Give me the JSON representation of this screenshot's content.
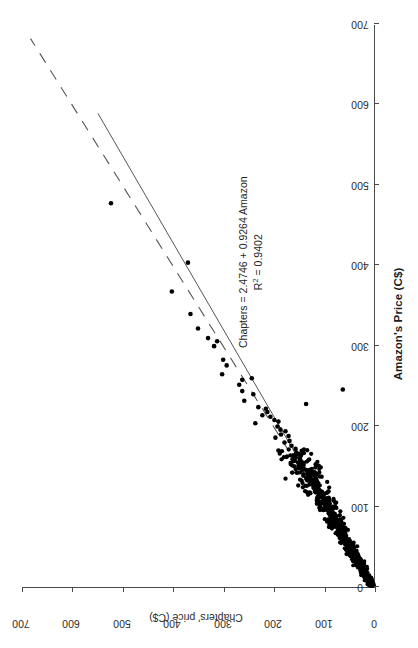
{
  "chart_data": {
    "type": "scatter",
    "title": "",
    "xlabel": "Amazon's Price (C$)",
    "ylabel": "Chapters' price (C$)",
    "xlim": [
      0,
      700
    ],
    "ylim": [
      0,
      700
    ],
    "xticks": [
      0,
      100,
      200,
      300,
      400,
      500,
      600,
      700
    ],
    "yticks": [
      0,
      100,
      200,
      300,
      400,
      500,
      600,
      700
    ],
    "grid": false,
    "legend": "none",
    "orientation": "page rotated 90 degrees (landscape chart on portrait page)",
    "annotations": [
      {
        "name": "regression-equation",
        "line1": "Chapters = 2.4746 + 0.9264 Amazon",
        "line2_prefix": "R",
        "line2_sup": "2",
        "line2_suffix": " = 0.9402",
        "x": 430,
        "y": 300
      }
    ],
    "fit_line": {
      "name": "regression-line",
      "style": "solid",
      "intercept": 2.4746,
      "slope": 0.9264,
      "x_start": 0,
      "x_end": 590
    },
    "reference_line": {
      "name": "identity-line",
      "style": "dashed",
      "intercept": 0,
      "slope": 1,
      "x_start": 0,
      "x_end": 683
    },
    "series": [
      {
        "name": "Book prices",
        "marker": "filled-circle",
        "color": "#000000",
        "n_points": 960,
        "outliers": [
          [
            478,
            523
          ],
          [
            404,
            370
          ],
          [
            368,
            402
          ],
          [
            340,
            365
          ],
          [
            322,
            350
          ],
          [
            310,
            330
          ],
          [
            306,
            312
          ],
          [
            300,
            318
          ],
          [
            283,
            300
          ],
          [
            276,
            293
          ],
          [
            265,
            302
          ],
          [
            260,
            243
          ],
          [
            258,
            262
          ],
          [
            252,
            268
          ],
          [
            244,
            262
          ],
          [
            240,
            240
          ],
          [
            232,
            258
          ],
          [
            228,
            135
          ],
          [
            224,
            230
          ],
          [
            222,
            215
          ],
          [
            218,
            212
          ],
          [
            214,
            222
          ],
          [
            212,
            206
          ],
          [
            208,
            198
          ],
          [
            206,
            190
          ],
          [
            204,
            236
          ],
          [
            200,
            192
          ],
          [
            196,
            186
          ],
          [
            194,
            176
          ],
          [
            190,
            185
          ],
          [
            188,
            170
          ],
          [
            186,
            196
          ],
          [
            182,
            168
          ],
          [
            180,
            178
          ],
          [
            176,
            164
          ],
          [
            172,
            156
          ],
          [
            170,
            190
          ],
          [
            166,
            150
          ],
          [
            164,
            160
          ],
          [
            160,
            148
          ],
          [
            156,
            145
          ],
          [
            152,
            140
          ],
          [
            150,
            158
          ],
          [
            146,
            136
          ],
          [
            144,
            130
          ],
          [
            140,
            132
          ],
          [
            136,
            128
          ],
          [
            134,
            124
          ],
          [
            130,
            126
          ],
          [
            128,
            118
          ],
          [
            124,
            120
          ],
          [
            120,
            112
          ],
          [
            118,
            116
          ],
          [
            114,
            108
          ],
          [
            112,
            110
          ],
          [
            108,
            100
          ],
          [
            106,
            104
          ],
          [
            104,
            98
          ],
          [
            100,
            96
          ],
          [
            98,
            92
          ],
          [
            96,
            100
          ],
          [
            94,
            88
          ],
          [
            92,
            90
          ],
          [
            90,
            84
          ],
          [
            88,
            86
          ],
          [
            86,
            80
          ],
          [
            84,
            82
          ],
          [
            82,
            78
          ],
          [
            80,
            76
          ],
          [
            78,
            74
          ],
          [
            76,
            72
          ],
          [
            74,
            70
          ],
          [
            72,
            68
          ],
          [
            70,
            66
          ],
          [
            68,
            64
          ],
          [
            66,
            62
          ],
          [
            64,
            60
          ],
          [
            62,
            58
          ],
          [
            60,
            56
          ],
          [
            246,
            62
          ]
        ]
      }
    ]
  },
  "axis": {
    "x_title": "Amazon's Price (C$)",
    "y_title": "Chapters' price (C$)",
    "x_tick_labels": [
      "0",
      "100",
      "200",
      "300",
      "400",
      "500",
      "600",
      "700"
    ],
    "y_tick_labels": [
      "0",
      "100",
      "200",
      "300",
      "400",
      "500",
      "600",
      "700"
    ]
  },
  "annotation": {
    "equation_text": "Chapters = 2.4746 + 0.9264 Amazon",
    "r_prefix": "R",
    "r_exponent": "2",
    "r_value": " = 0.9402"
  },
  "colors": {
    "marker": "#000000",
    "axis": "#4a4a4a",
    "text": "#1d1d1d",
    "background": "#ffffff"
  }
}
